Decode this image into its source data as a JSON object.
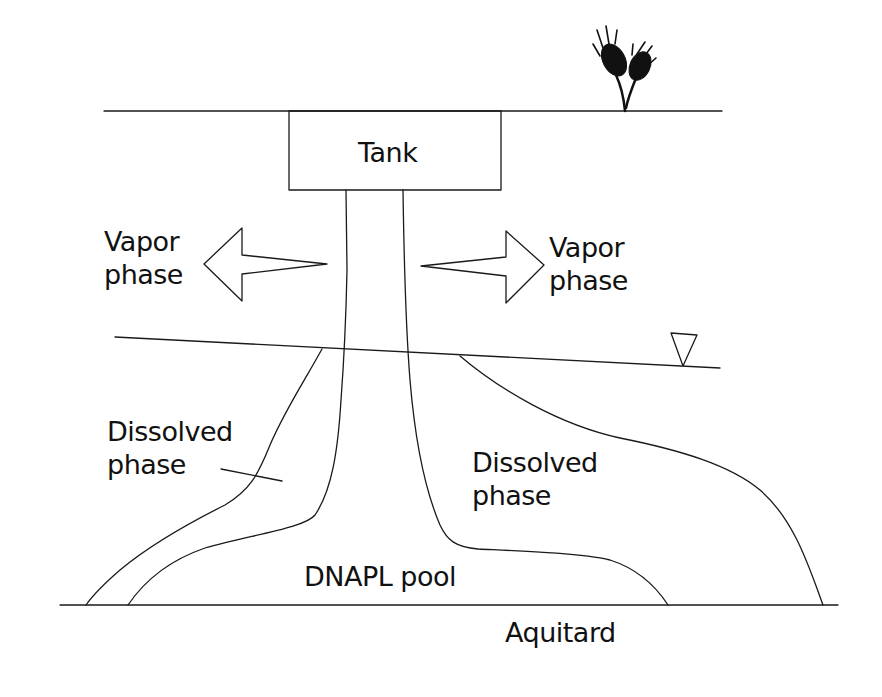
{
  "diagram": {
    "type": "DNAPL contamination cross-section",
    "labels": {
      "tank": "Tank",
      "vapor_left_line1": "Vapor",
      "vapor_left_line2": "phase",
      "vapor_right_line1": "Vapor",
      "vapor_right_line2": "phase",
      "dissolved_left_line1": "Dissolved",
      "dissolved_left_line2": "phase",
      "dissolved_right_line1": "Dissolved",
      "dissolved_right_line2": "phase",
      "dnapl_pool": "DNAPL pool",
      "aquitard": "Aquitard"
    },
    "symbols": {
      "water_table": "inverted-triangle",
      "vegetation": "plant"
    },
    "colors": {
      "line": "#1a1a1a",
      "background": "#ffffff"
    }
  }
}
